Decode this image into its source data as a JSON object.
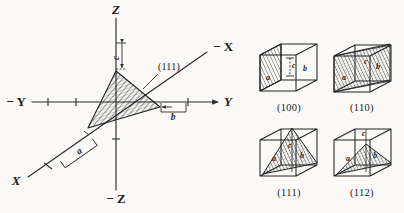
{
  "figure": {
    "background_color": "#fbfaf8",
    "ink_color": "#232323",
    "description_kind": "crystallographic-miller-indices-figure"
  },
  "axes_diagram": {
    "name": "crystal-axes-with-111-plane",
    "axis_labels": {
      "z_positive": "Z",
      "z_negative": "− Z",
      "y_positive": "Y",
      "y_negative": "− Y",
      "x_positive": "X",
      "x_negative": "− X"
    },
    "intercept_labels": {
      "a": "a",
      "b": "b",
      "c": "c"
    },
    "plane_annotation": "(111)"
  },
  "cubes": [
    {
      "id": "cube-100",
      "caption": "(100)",
      "labels": {
        "a": "a",
        "b": "b",
        "c": "c"
      }
    },
    {
      "id": "cube-110",
      "caption": "(110)",
      "labels": {
        "a": "a",
        "b": "b",
        "c": "c"
      }
    },
    {
      "id": "cube-111",
      "caption": "(111)",
      "labels": {
        "a": "a",
        "b": "b",
        "c": "c"
      }
    },
    {
      "id": "cube-112",
      "caption": "(112)",
      "labels": {
        "a": "a",
        "b": "b",
        "c": "c"
      }
    }
  ]
}
